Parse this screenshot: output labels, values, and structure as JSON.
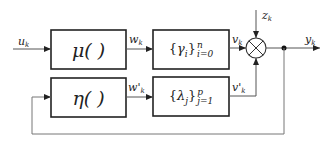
{
  "diagram": {
    "type": "block-diagram",
    "colors": {
      "line": "#333333",
      "box_border": "#222222",
      "background": "#ffffff"
    },
    "blocks": [
      {
        "id": "mu",
        "label": "μ( )"
      },
      {
        "id": "eta",
        "label": "η( )"
      },
      {
        "id": "gamma",
        "set_symbol": "γ",
        "set_sub": "i",
        "sup": "n",
        "sub": "i=0"
      },
      {
        "id": "lambda",
        "set_symbol": "λ",
        "set_sub": "j",
        "sup": "p",
        "sub": "j=1"
      }
    ],
    "signals": {
      "u": {
        "base": "u",
        "sub": "k"
      },
      "w": {
        "base": "w",
        "sub": "k"
      },
      "w_prime": {
        "base": "w'",
        "sub": "k"
      },
      "v": {
        "base": "v",
        "sub": "k"
      },
      "v_prime": {
        "base": "v'",
        "sub": "k"
      },
      "z": {
        "base": "z",
        "sub": "k"
      },
      "y": {
        "base": "y",
        "sub": "k"
      }
    },
    "multiplier_symbol": "⊗"
  }
}
